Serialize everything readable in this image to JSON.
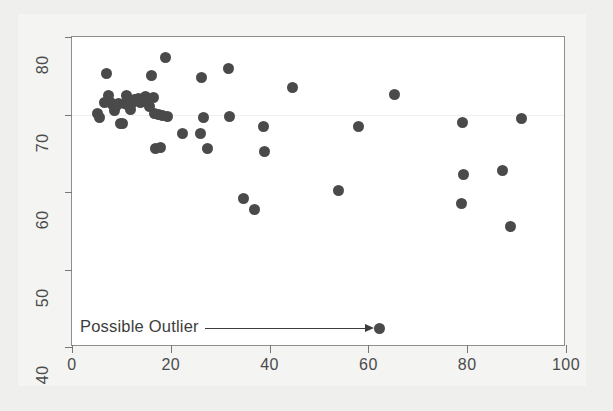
{
  "chart_data": {
    "type": "scatter",
    "title": "",
    "xlabel": "",
    "ylabel": "",
    "xlim": [
      0,
      100
    ],
    "ylim": [
      40,
      80
    ],
    "xticks": [
      0,
      20,
      40,
      60,
      80,
      100
    ],
    "yticks": [
      40,
      50,
      60,
      70,
      80
    ],
    "xtick_labels": [
      "0",
      "20",
      "40",
      "60",
      "80",
      "100"
    ],
    "ytick_labels": [
      "40",
      "50",
      "60",
      "70",
      "80"
    ],
    "grid": "faint horizontal gridline at y = 70",
    "legend": "none",
    "marker": {
      "shape": "circle",
      "color": "#4a4a4a",
      "size_px": 11
    },
    "points": [
      {
        "x": 5.2,
        "y": 70.1
      },
      {
        "x": 5.6,
        "y": 69.6
      },
      {
        "x": 6.5,
        "y": 71.6
      },
      {
        "x": 7.0,
        "y": 75.3
      },
      {
        "x": 7.4,
        "y": 72.5
      },
      {
        "x": 7.8,
        "y": 71.5
      },
      {
        "x": 8.2,
        "y": 71.3
      },
      {
        "x": 8.6,
        "y": 70.5
      },
      {
        "x": 9.0,
        "y": 71.2
      },
      {
        "x": 9.4,
        "y": 71.4
      },
      {
        "x": 9.8,
        "y": 68.8
      },
      {
        "x": 10.3,
        "y": 68.8
      },
      {
        "x": 10.6,
        "y": 71.4
      },
      {
        "x": 11.0,
        "y": 72.5
      },
      {
        "x": 11.4,
        "y": 71.1
      },
      {
        "x": 11.8,
        "y": 70.7
      },
      {
        "x": 12.2,
        "y": 71.5
      },
      {
        "x": 12.6,
        "y": 72.0
      },
      {
        "x": 13.0,
        "y": 71.9
      },
      {
        "x": 13.4,
        "y": 72.1
      },
      {
        "x": 13.9,
        "y": 71.6
      },
      {
        "x": 14.3,
        "y": 71.9
      },
      {
        "x": 14.8,
        "y": 72.3
      },
      {
        "x": 15.2,
        "y": 71.7
      },
      {
        "x": 15.6,
        "y": 71.0
      },
      {
        "x": 16.0,
        "y": 75.0
      },
      {
        "x": 16.4,
        "y": 72.2
      },
      {
        "x": 16.6,
        "y": 70.1
      },
      {
        "x": 16.9,
        "y": 65.6
      },
      {
        "x": 17.5,
        "y": 70.0
      },
      {
        "x": 17.9,
        "y": 65.7
      },
      {
        "x": 18.4,
        "y": 69.9
      },
      {
        "x": 19.0,
        "y": 77.3
      },
      {
        "x": 19.4,
        "y": 69.8
      },
      {
        "x": 22.3,
        "y": 67.6
      },
      {
        "x": 26.0,
        "y": 67.6
      },
      {
        "x": 26.2,
        "y": 74.8
      },
      {
        "x": 26.6,
        "y": 69.6
      },
      {
        "x": 27.4,
        "y": 65.6
      },
      {
        "x": 31.7,
        "y": 75.9
      },
      {
        "x": 31.9,
        "y": 69.8
      },
      {
        "x": 34.8,
        "y": 59.2
      },
      {
        "x": 36.9,
        "y": 57.8
      },
      {
        "x": 38.8,
        "y": 68.4
      },
      {
        "x": 38.9,
        "y": 65.2
      },
      {
        "x": 44.7,
        "y": 73.5
      },
      {
        "x": 53.9,
        "y": 60.2
      },
      {
        "x": 57.9,
        "y": 68.4
      },
      {
        "x": 62.2,
        "y": 42.4
      },
      {
        "x": 65.3,
        "y": 72.6
      },
      {
        "x": 79.0,
        "y": 69.0
      },
      {
        "x": 79.2,
        "y": 62.2
      },
      {
        "x": 78.9,
        "y": 58.5
      },
      {
        "x": 87.2,
        "y": 62.8
      },
      {
        "x": 88.7,
        "y": 55.6
      },
      {
        "x": 91.0,
        "y": 69.5
      }
    ],
    "annotations": [
      {
        "text": "Possible Outlier",
        "points_to": {
          "x": 62.2,
          "y": 42.4
        },
        "style": "arrow"
      }
    ]
  }
}
